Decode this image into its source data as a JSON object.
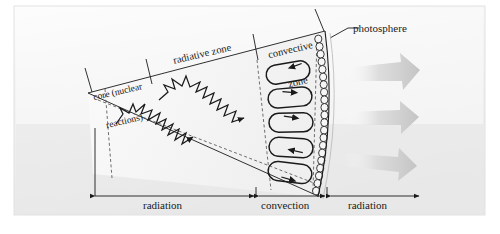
{
  "figure": {
    "background_color": "#ffffff",
    "plate_color": "#eeeeee",
    "line_color": "#1a1a1a",
    "wedge_fill": "#f3f3f3",
    "convective_fill": "#e6e6e6",
    "arrow_color": "#d6d6d6"
  },
  "labels": {
    "core": "core (nuclear\nreactions)",
    "core_line1": "core (nuclear",
    "core_line2": "reactions)",
    "radiative_zone": "radiative zone",
    "convective_zone": "convective\nzone",
    "convective_zone_line1": "convective",
    "convective_zone_line2": "zone",
    "photosphere": "photosphere"
  },
  "scale_bar": {
    "segments": [
      {
        "label": "radiation",
        "start_x": 95,
        "end_x": 256
      },
      {
        "label": "convection",
        "start_x": 258,
        "end_x": 327
      },
      {
        "label": "radiation",
        "start_x": 331,
        "end_x": 421
      }
    ],
    "baseline_y": 196
  },
  "zones": [
    {
      "name": "core",
      "description": "nuclear reactions region at the wedge apex"
    },
    {
      "name": "radiative-zone",
      "description": "photon random-walk zigzag paths"
    },
    {
      "name": "convective-zone",
      "description": "five convection cell loops"
    },
    {
      "name": "photosphere",
      "description": "granulation bubbles along the outer curved edge"
    }
  ],
  "counts": {
    "convection_cells": 5,
    "photon_paths": 2,
    "escaping_radiation_arrows": 3,
    "photosphere_bubbles": 22
  }
}
